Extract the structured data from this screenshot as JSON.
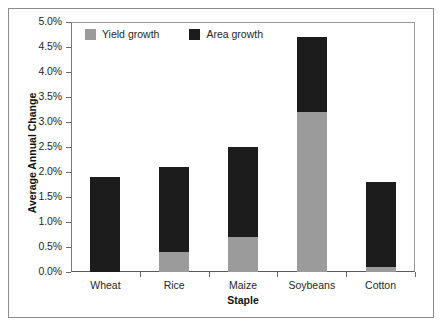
{
  "chart_data": {
    "type": "bar",
    "subtype": "stacked-column",
    "title": "",
    "xlabel": "Staple",
    "ylabel": "Average Annual Change",
    "categories": [
      "Wheat",
      "Rice",
      "Maize",
      "Soybeans",
      "Cotton"
    ],
    "series": [
      {
        "name": "Yield growth",
        "color": "#9b9b9b",
        "values": [
          0.0,
          0.4,
          0.7,
          3.2,
          0.1
        ]
      },
      {
        "name": "Area growth",
        "color": "#1c1c1c",
        "values": [
          1.9,
          1.7,
          1.8,
          1.5,
          1.7
        ]
      }
    ],
    "totals": [
      1.9,
      2.1,
      2.5,
      4.7,
      1.8
    ],
    "ylim": [
      0.0,
      5.0
    ],
    "ytick_values": [
      0.0,
      0.5,
      1.0,
      1.5,
      2.0,
      2.5,
      3.0,
      3.5,
      4.0,
      4.5,
      5.0
    ],
    "ytick_labels": [
      "0.0%",
      "0.5%",
      "1.0%",
      "1.5%",
      "2.0%",
      "2.5%",
      "3.0%",
      "3.5%",
      "4.0%",
      "4.5%",
      "5.0%"
    ],
    "grid": false,
    "legend_position": "top-left-inside",
    "legend": [
      "Yield growth",
      "Area growth"
    ],
    "value_unit": "percent"
  },
  "legend": {
    "items": [
      {
        "label": "Yield growth",
        "color": "#9b9b9b"
      },
      {
        "label": "Area growth",
        "color": "#1c1c1c"
      }
    ]
  },
  "axes": {
    "y_title": "Average Annual Change",
    "x_title": "Staple"
  }
}
